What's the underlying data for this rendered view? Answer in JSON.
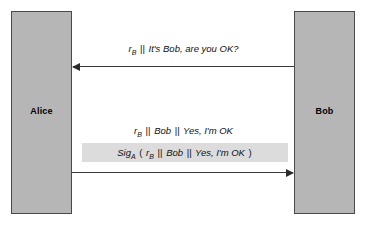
{
  "diagram": {
    "type": "protocol-sequence-diagram",
    "background_color": "#ffffff",
    "party_fill_color": "#b6b6b6",
    "party_border_color": "#4a4a4a",
    "highlight_band_color": "#dcdcdc",
    "arrow_color": "#2b2b2b"
  },
  "parties": {
    "left": {
      "label": "Alice"
    },
    "right": {
      "label": "Bob"
    }
  },
  "messages": [
    {
      "id": "msg1",
      "direction": "right-to-left",
      "from": "Bob",
      "to": "Alice",
      "parts": {
        "nonce_symbol": "r",
        "nonce_subscript": "B",
        "separator": "||",
        "payload": "It's Bob, are you OK?"
      },
      "full_text": "rB || It's Bob, are you OK?",
      "highlighted": false
    },
    {
      "id": "msg2",
      "direction": "left-to-right",
      "from": "Alice",
      "to": "Bob",
      "parts": {
        "nonce_symbol": "r",
        "nonce_subscript": "B",
        "separator1": "||",
        "identity": "Bob",
        "separator2": "||",
        "payload": "Yes, I'm OK"
      },
      "full_text": "rB || Bob || Yes, I'm OK",
      "highlighted": false
    },
    {
      "id": "msg3",
      "direction": "left-to-right",
      "from": "Alice",
      "to": "Bob",
      "parts": {
        "signature_symbol": "Sig",
        "signature_subscript": "A",
        "open_paren": "(",
        "nonce_symbol": "r",
        "nonce_subscript": "B",
        "separator1": "||",
        "identity": "Bob",
        "separator2": "||",
        "payload": "Yes, I'm OK",
        "close_paren": ")"
      },
      "full_text": "SigA ( rB || Bob || Yes, I'm OK )",
      "highlighted": true
    }
  ]
}
